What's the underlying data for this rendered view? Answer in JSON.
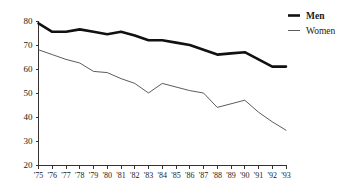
{
  "chart_data": {
    "type": "line",
    "title": "",
    "subtitle": "",
    "xlabel": "",
    "ylabel": "",
    "xlim": [
      1975,
      1993
    ],
    "ylim": [
      20,
      80
    ],
    "yticks": [
      20,
      30,
      40,
      50,
      60,
      70,
      80
    ],
    "ytick_labels": [
      "20",
      "30",
      "40",
      "50",
      "60",
      "70",
      "80"
    ],
    "grid": false,
    "legend_position": "top-right",
    "categories": [
      "'75",
      "'76",
      "'77",
      "'78",
      "'79",
      "'80",
      "'81",
      "'82",
      "'83",
      "'84",
      "'85",
      "'86",
      "'87",
      "'88",
      "'89",
      "'90",
      "'91",
      "'92",
      "'93"
    ],
    "series": [
      {
        "name": "Men",
        "style": "thick-black",
        "color": "#111111",
        "values": [
          79,
          75.5,
          75.5,
          76.5,
          75.5,
          74.5,
          75.5,
          74,
          72,
          72,
          71,
          70,
          68,
          66,
          66.5,
          67,
          64,
          61,
          61
        ]
      },
      {
        "name": "Women",
        "style": "thin-grey",
        "color": "#4a4a4a",
        "values": [
          68,
          66,
          64,
          62.5,
          59,
          58.5,
          56,
          54,
          50,
          54,
          52.5,
          51,
          50,
          44,
          45.5,
          47,
          42,
          38,
          34.5
        ]
      }
    ]
  },
  "legend": {
    "items": [
      {
        "label": "Men",
        "style": "thick-black"
      },
      {
        "label": "Women",
        "style": "thin-grey"
      }
    ]
  },
  "colors": {
    "men_line": "#111111",
    "women_line": "#4a4a4a",
    "axis": "#333333",
    "background": "#ffffff"
  }
}
